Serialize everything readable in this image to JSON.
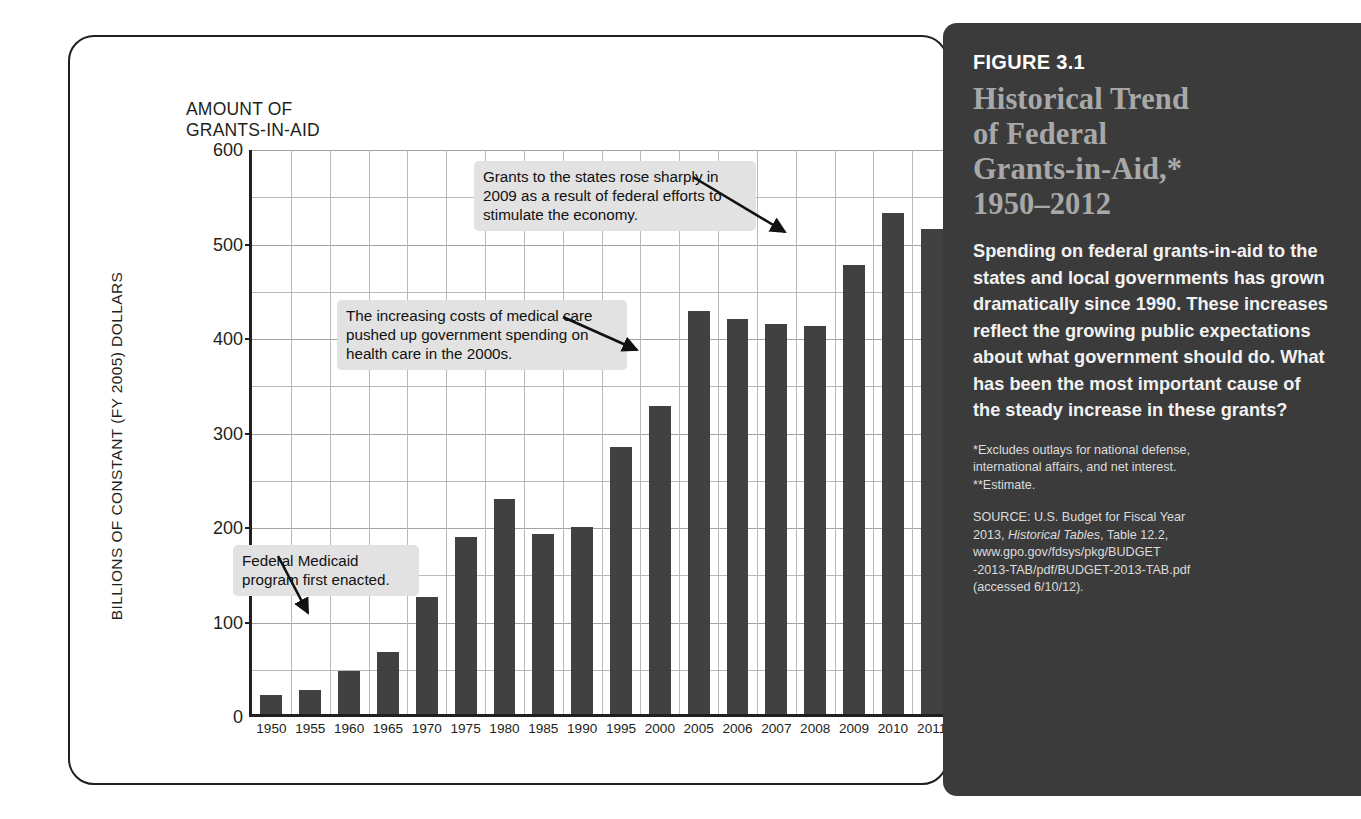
{
  "figure": {
    "label": "FIGURE 3.1",
    "title": "Historical Trend\nof Federal\nGrants-in-Aid,*\n1950–2012",
    "body": "Spending on federal grants-in-aid to the states and local governments has grown dramatically since 1990. These increases reflect the growing public expectations about what government should do. What has been the most important cause of the steady increase in these grants?",
    "notes": "*Excludes outlays for national defense,\ninternational affairs, and net interest.\n**Estimate.",
    "source_prefix": "SOURCE: U.S. Budget for Fiscal Year\n2013, ",
    "source_italic": "Historical Tables",
    "source_suffix": ", Table 12.2,\nwww.gpo.gov/fdsys/pkg/BUDGET\n-2013-TAB/pdf/BUDGET-2013-TAB.pdf\n(accessed 6/10/12).",
    "panel_bg": "#3b3b3b",
    "title_color": "#a8a8a8"
  },
  "chart_data": {
    "type": "bar",
    "title": "AMOUNT OF\nGRANTS-IN-AID",
    "xlabel": "",
    "ylabel": "BILLIONS OF CONSTANT (FY 2005) DOLLARS",
    "ylim": [
      0,
      600
    ],
    "yticks": [
      0,
      100,
      200,
      300,
      400,
      500,
      600
    ],
    "ytick_labels": [
      "0",
      "100",
      "200",
      "300",
      "400",
      "500",
      "600"
    ],
    "minor_gridline_step": 50,
    "grid": true,
    "legend": "none",
    "bar_color": "#414141",
    "categories": [
      "1950",
      "1955",
      "1960",
      "1965",
      "1970",
      "1975",
      "1980",
      "1985",
      "1990",
      "1995",
      "2000",
      "2005",
      "2006",
      "2007",
      "2008",
      "2009",
      "2010",
      "2011",
      "2012**"
    ],
    "values": [
      20,
      25,
      45,
      66,
      124,
      187,
      228,
      190,
      198,
      283,
      326,
      427,
      418,
      413,
      411,
      475,
      530,
      513,
      503
    ],
    "annotations": [
      {
        "text": "Grants to the states rose sharply in\n2009 as a result of federal efforts to\nstimulate the economy.",
        "points_to": "2009"
      },
      {
        "text": "The increasing costs of medical care\npushed up government spending on\nhealth care in the 2000s.",
        "points_to": "2005"
      },
      {
        "text": "Federal Medicaid\nprogram first enacted.",
        "points_to": "1965"
      }
    ]
  }
}
